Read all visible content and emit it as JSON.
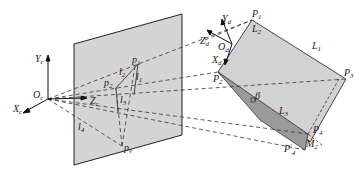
{
  "diagram": {
    "camera_frame": {
      "origin": "O",
      "origin_sub": "c",
      "x": "X",
      "x_sub": "c",
      "y": "Y",
      "y_sub": "c",
      "z": "Z",
      "z_sub": "c"
    },
    "target_frame": {
      "origin": "O",
      "origin_sub": "d",
      "x": "X",
      "x_sub": "d",
      "y": "Y",
      "y_sub": "d",
      "z": "Z",
      "z_sub": "d"
    },
    "image_points": {
      "p1": "p",
      "p1_sub": "1",
      "p2": "p",
      "p2_sub": "2",
      "pv": "p",
      "pv_sub": "v"
    },
    "image_lines": {
      "l1": "l",
      "l1_sub": "1",
      "l2": "l",
      "l2_sub": "2",
      "l3": "l",
      "l3_sub": "3",
      "l4": "l",
      "l4_sub": "4"
    },
    "world_points": {
      "P1": "P",
      "P1_sub": "1",
      "P2": "P",
      "P2_sub": "2",
      "P3": "P",
      "P3_sub": "3",
      "P4": "P",
      "P4_sub": "4",
      "P4p": "P",
      "P4p_sub": "4",
      "P4p_sup": "′"
    },
    "world_lines": {
      "L1": "L",
      "L1_sub": "1",
      "L2": "L",
      "L2_sub": "2",
      "L3": "L",
      "L3_sub": "3"
    },
    "angle": "β",
    "other": {
      "M": "M",
      "M_sub": "2"
    }
  }
}
